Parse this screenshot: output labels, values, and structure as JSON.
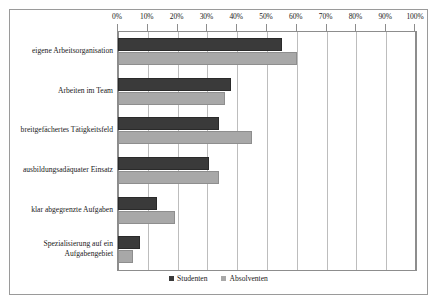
{
  "chart_data": {
    "type": "bar",
    "orientation": "horizontal",
    "title": "",
    "subtitle": "",
    "xlabel": "",
    "ylabel": "",
    "xlim": [
      0,
      100
    ],
    "xtick_labels": [
      "0%",
      "10%",
      "20%",
      "30%",
      "40%",
      "50%",
      "60%",
      "70%",
      "80%",
      "90%",
      "100%"
    ],
    "xtick_values": [
      0,
      10,
      20,
      30,
      40,
      50,
      60,
      70,
      80,
      90,
      100
    ],
    "grid": true,
    "legend_position": "bottom",
    "categories": [
      "eigene Arbeitsorganisation",
      "Arbeiten im Team",
      "breitgefächertes Tätigkeitsfeld",
      "ausbildungsadäquater Einsatz",
      "klar abgegrenzte Aufgaben",
      "Spezialisierung auf ein\nAufgabengebiet"
    ],
    "series": [
      {
        "name": "Studenten",
        "color": "#3a3a3a",
        "values": [
          55,
          38,
          34,
          30.5,
          13,
          7.5
        ]
      },
      {
        "name": "Absolventen",
        "color": "#a8a8a8",
        "values": [
          60,
          36,
          45,
          34,
          19,
          5
        ]
      }
    ]
  },
  "legend": {
    "items": [
      {
        "label": "Studenten"
      },
      {
        "label": "Absolventen"
      }
    ]
  },
  "colors": {
    "students": "#3a3a3a",
    "graduates": "#a8a8a8",
    "grid": "#bdbdbd",
    "axis": "#8d8d8d",
    "frame": "#9a9a9a",
    "text": "#1a1a1a",
    "background": "#ffffff"
  }
}
